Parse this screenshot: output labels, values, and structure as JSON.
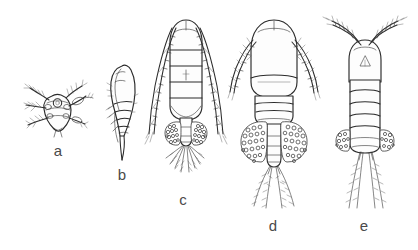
{
  "plate": {
    "title": "Copepod life-stage and species plate",
    "background_color": "#ffffff",
    "ink_color": "#2b2b2b",
    "label_color": "#4a4a4a",
    "width": 418,
    "height": 250
  },
  "figures": [
    {
      "id": "a",
      "label": "a",
      "name": "nauplius-larva",
      "description": "Small rounded nauplius larva in ventral view with three pairs of radiating plumose appendages and a central eye spot",
      "view": "ventral",
      "label_x": 46,
      "label_y": 143,
      "figure_x": 22,
      "figure_y": 72,
      "figure_width": 72,
      "figure_height": 68
    },
    {
      "id": "b",
      "label": "b",
      "name": "copepodite-lateral",
      "description": "Copepodite stage in lateral view with tapering curved body, segmented urosome and a pointed posterior",
      "view": "lateral",
      "label_x": 110,
      "label_y": 167,
      "figure_x": 104,
      "figure_y": 60,
      "figure_width": 44,
      "figure_height": 102
    },
    {
      "id": "c",
      "label": "c",
      "name": "adult-female-elongate",
      "description": "Adult female with elongate segmented prosome, very long jointed antennules, paired granular egg sacs and a fan of plumose caudal setae",
      "view": "dorsal",
      "label_x": 171,
      "label_y": 192,
      "figure_x": 142,
      "figure_y": 14,
      "figure_width": 88,
      "figure_height": 176
    },
    {
      "id": "d",
      "label": "d",
      "name": "adult-female-broad",
      "description": "Adult female with broad oval prosome, short feathered antennules, large granular egg sacs and four long plumose caudal rami",
      "view": "dorsal",
      "label_x": 261,
      "label_y": 218,
      "figure_x": 228,
      "figure_y": 16,
      "figure_width": 92,
      "figure_height": 196
    },
    {
      "id": "e",
      "label": "e",
      "name": "adult-female-slender",
      "description": "Adult female with slender segmented body, outward-splayed geniculate antennules, triangular eye marking and two long caudal setae",
      "view": "dorsal",
      "label_x": 352,
      "label_y": 218,
      "figure_x": 318,
      "figure_y": 12,
      "figure_width": 94,
      "figure_height": 198
    }
  ]
}
